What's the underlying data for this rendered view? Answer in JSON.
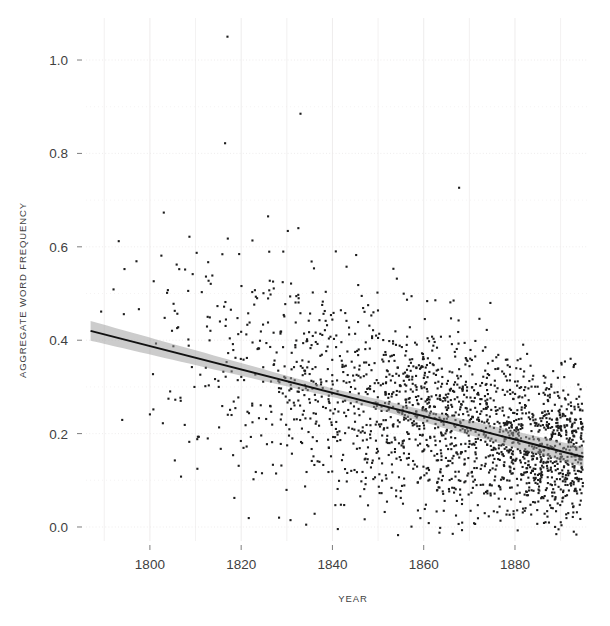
{
  "chart_data": {
    "type": "scatter",
    "title": "",
    "xlabel": "YEAR",
    "ylabel": "AGGREGATE WORD FREQUENCY",
    "xlim": [
      1786,
      1896
    ],
    "ylim": [
      -0.03,
      1.09
    ],
    "xticks": [
      1800,
      1820,
      1840,
      1860,
      1880
    ],
    "xtick_labels": [
      "1800",
      "1820",
      "1840",
      "1860",
      "1880"
    ],
    "yticks": [
      0.0,
      0.2,
      0.4,
      0.6,
      0.8,
      1.0
    ],
    "ytick_labels": [
      "0.0",
      "0.2",
      "0.4",
      "0.6",
      "0.8",
      "1.0"
    ],
    "grid": true,
    "grid_color": "#eceaea",
    "legend": "none",
    "point_color": "#1c1c1c",
    "point_size": 2.1,
    "n_points": 2000,
    "series": [
      {
        "name": "aggregate word frequency",
        "marker": "square",
        "description": "Aggregate word frequency per text plotted against year of publication; density of observations rises sharply after 1860 while vertical spread narrows."
      }
    ],
    "trend": {
      "type": "linear regression with confidence band",
      "line_color": "#111111",
      "band_color": "#9a9a9a",
      "x_start": 1787,
      "x_end": 1895,
      "y_start": 0.42,
      "y_end": 0.15,
      "slope_per_year": -0.0025,
      "intercept_at_1787": 0.42
    },
    "annotations": [
      {
        "text": "high outlier",
        "x": 1817,
        "y": 1.05
      },
      {
        "text": "high outlier",
        "x": 1833,
        "y": 0.885
      }
    ]
  }
}
